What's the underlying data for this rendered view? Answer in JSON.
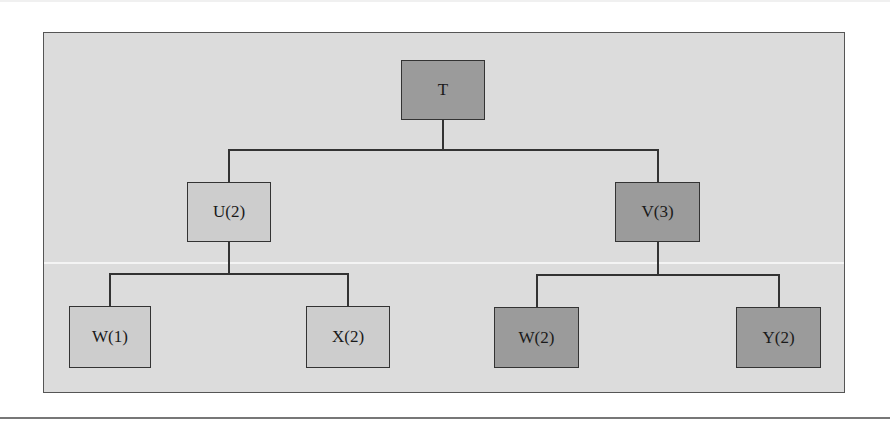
{
  "diagram": {
    "type": "tree",
    "colors": {
      "background": "#dcdcdc",
      "highlighted_node": "#9b9b9b",
      "plain_node": "#cdcdcd",
      "line": "#333333"
    },
    "root": {
      "label": "T",
      "highlighted": true
    },
    "level1": [
      {
        "label": "U(2)",
        "highlighted": false
      },
      {
        "label": "V(3)",
        "highlighted": true
      }
    ],
    "level2": [
      {
        "label": "W(1)",
        "parent": "U(2)",
        "highlighted": false
      },
      {
        "label": "X(2)",
        "parent": "U(2)",
        "highlighted": false
      },
      {
        "label": "W(2)",
        "parent": "V(3)",
        "highlighted": true
      },
      {
        "label": "Y(2)",
        "parent": "V(3)",
        "highlighted": true
      }
    ]
  }
}
